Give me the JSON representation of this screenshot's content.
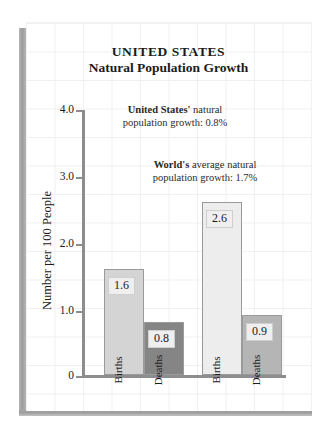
{
  "chart_data": {
    "type": "bar",
    "title": "UNITED STATES",
    "subtitle": "Natural Population Growth",
    "xlabel": "",
    "ylabel": "Number per 100 People",
    "ylim": [
      0,
      4.0
    ],
    "yticks": [
      "4.0",
      "3.0",
      "2.0",
      "1.0",
      "0"
    ],
    "grid": true,
    "legend": "none",
    "groups": [
      {
        "name": "United States",
        "bars": [
          {
            "category": "Births",
            "value": 1.6,
            "label": "1.6",
            "color": "#d4d4d4"
          },
          {
            "category": "Deaths",
            "value": 0.8,
            "label": "0.8",
            "color": "#858585"
          }
        ]
      },
      {
        "name": "World",
        "bars": [
          {
            "category": "Births",
            "value": 2.6,
            "label": "2.6",
            "color": "#ededed"
          },
          {
            "category": "Deaths",
            "value": 0.9,
            "label": "0.9",
            "color": "#b5b5b5"
          }
        ]
      }
    ],
    "categories": [
      "Births",
      "Deaths",
      "Births",
      "Deaths"
    ],
    "values": [
      1.6,
      0.8,
      2.6,
      0.9
    ],
    "annotations": [
      {
        "id": "united-states",
        "bold_text": "United States'",
        "rest_line1": " natural",
        "line2": "population growth:  0.8%",
        "value": "0.8%"
      },
      {
        "id": "world",
        "bold_text": "World's",
        "rest_line1": " average natural",
        "line2": "population growth:  1.7%",
        "value": "1.7%"
      }
    ]
  }
}
